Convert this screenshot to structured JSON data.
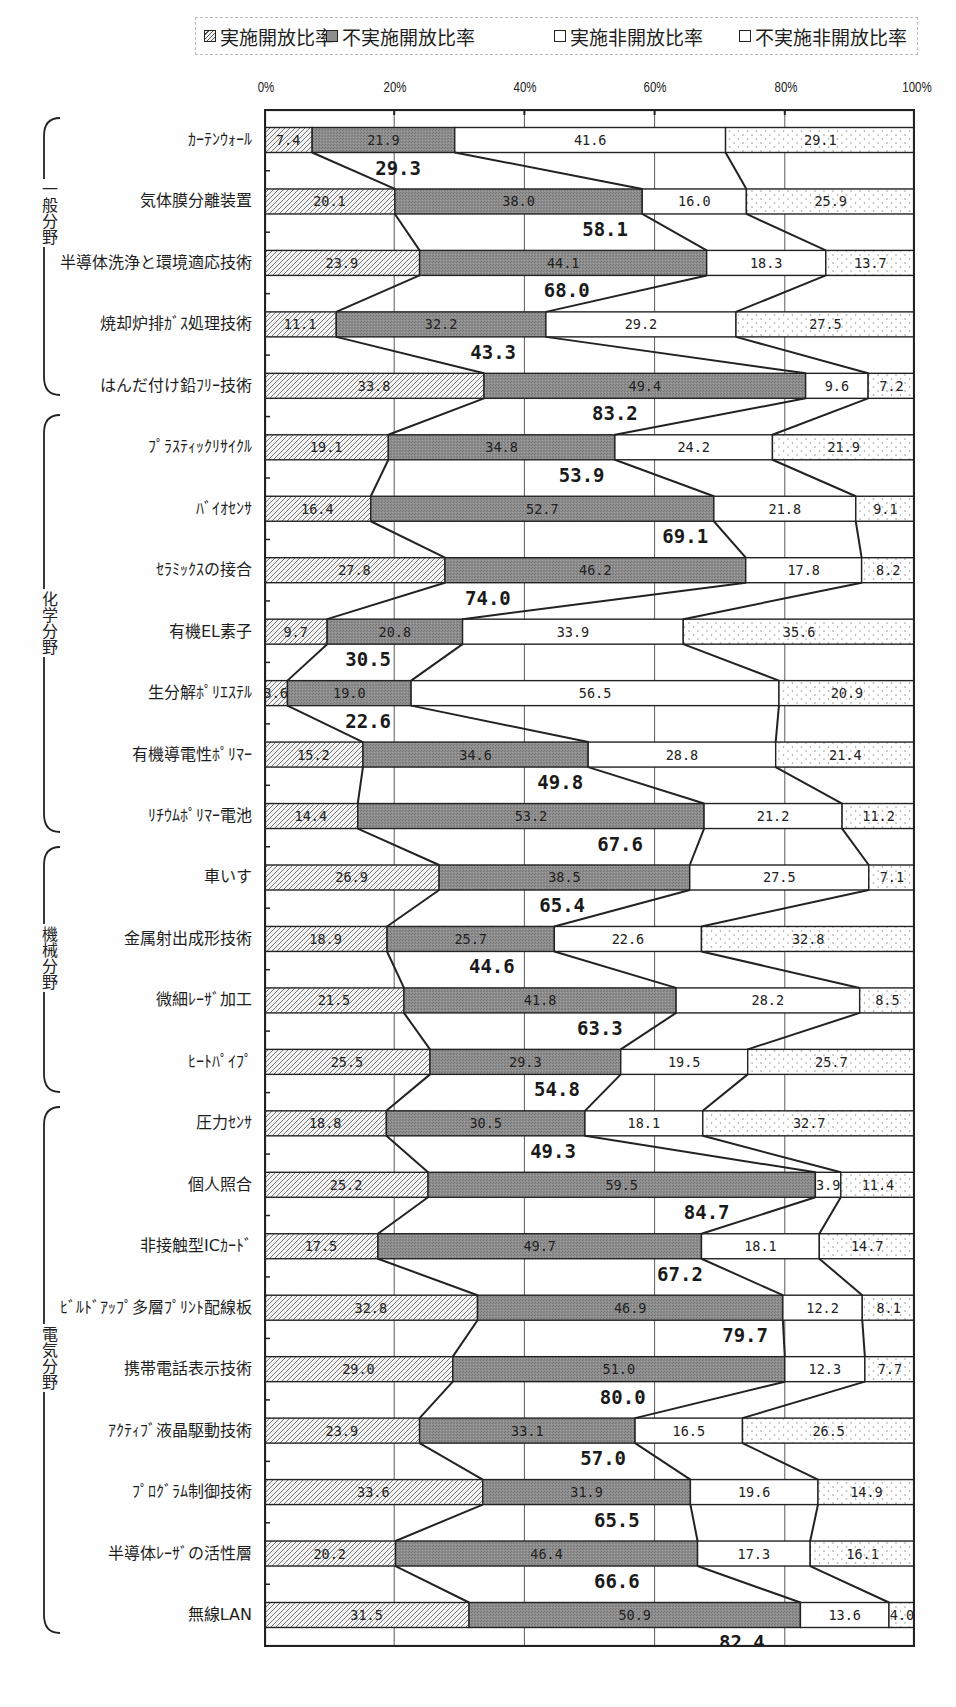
{
  "legend": {
    "items": [
      {
        "label": "実施開放比率",
        "pattern": "hatched"
      },
      {
        "label": "不実施開放比率",
        "pattern": "dark-stipple"
      },
      {
        "label": "実施非開放比率",
        "pattern": "white"
      },
      {
        "label": "不実施非開放比率",
        "pattern": "dotted"
      }
    ]
  },
  "chart_data": {
    "type": "bar",
    "orientation": "horizontal",
    "stacked": true,
    "title": "",
    "xlabel": "",
    "ylabel": "",
    "xlim": [
      0,
      100
    ],
    "x_ticks": [
      "0%",
      "20%",
      "40%",
      "60%",
      "80%",
      "100%"
    ],
    "grid": {
      "vertical": true,
      "horizontal": false
    },
    "legend_position": "top",
    "categories": [
      "ｶｰﾃﾝｳｫｰﾙ",
      "気体膜分離装置",
      "半導体洗浄と環境適応技術",
      "焼却炉排ｶﾞｽ処理技術",
      "はんだ付け鉛ﾌﾘｰ技術",
      "ﾌﾟﾗｽﾃｨｯｸﾘｻｲｸﾙ",
      "ﾊﾞｲｵｾﾝｻ",
      "ｾﾗﾐｯｸｽの接合",
      "有機EL素子",
      "生分解ﾎﾟﾘｴｽﾃﾙ",
      "有機導電性ﾎﾟﾘﾏｰ",
      "ﾘﾁｳﾑﾎﾟﾘﾏｰ電池",
      "車いす",
      "金属射出成形技術",
      "微細ﾚｰｻﾞ加工",
      "ﾋｰﾄﾊﾟｲﾌﾟ",
      "圧力ｾﾝｻ",
      "個人照合",
      "非接触型ICｶｰﾄﾞ",
      "ﾋﾞﾙﾄﾞｱｯﾌﾟ多層ﾌﾟﾘﾝﾄ配線板",
      "携帯電話表示技術",
      "ｱｸﾃｨﾌﾞ液晶駆動技術",
      "ﾌﾟﾛｸﾞﾗﾑ制御技術",
      "半導体ﾚｰｻﾞの活性層",
      "無線LAN"
    ],
    "groups": [
      {
        "label": "一般分野",
        "first": 0,
        "last": 4
      },
      {
        "label": "化学分野",
        "first": 5,
        "last": 11
      },
      {
        "label": "機械分野",
        "first": 12,
        "last": 15
      },
      {
        "label": "電気分野",
        "first": 16,
        "last": 24
      }
    ],
    "series": [
      {
        "name": "実施開放比率",
        "pattern": "hatched",
        "values": [
          7.4,
          20.1,
          23.9,
          11.1,
          33.8,
          19.1,
          16.4,
          27.8,
          9.7,
          3.6,
          15.2,
          14.4,
          26.9,
          18.9,
          21.5,
          25.5,
          18.8,
          25.2,
          17.5,
          32.8,
          29.0,
          23.9,
          33.6,
          20.2,
          31.5
        ]
      },
      {
        "name": "不実施開放比率",
        "pattern": "dark-stipple",
        "values": [
          21.9,
          38.0,
          44.1,
          32.2,
          49.4,
          34.8,
          52.7,
          46.2,
          20.8,
          19.0,
          34.6,
          53.2,
          38.5,
          25.7,
          41.8,
          29.3,
          30.5,
          59.5,
          49.7,
          46.9,
          51.0,
          33.1,
          31.9,
          46.4,
          50.9
        ]
      },
      {
        "name": "実施非開放比率",
        "pattern": "white",
        "values": [
          41.6,
          16.0,
          18.3,
          29.2,
          9.6,
          24.2,
          21.8,
          17.8,
          33.9,
          56.5,
          28.8,
          21.2,
          27.5,
          22.6,
          28.2,
          19.5,
          18.1,
          3.9,
          18.1,
          12.2,
          12.3,
          16.5,
          19.6,
          17.3,
          13.6
        ]
      },
      {
        "name": "不実施非開放比率",
        "pattern": "dotted",
        "values": [
          29.1,
          25.9,
          13.7,
          27.5,
          7.2,
          21.9,
          9.1,
          8.2,
          35.6,
          20.9,
          21.4,
          11.2,
          7.1,
          32.8,
          8.5,
          25.7,
          32.7,
          11.4,
          14.7,
          8.1,
          7.7,
          26.5,
          14.9,
          16.1,
          4.0
        ]
      }
    ],
    "annotations": {
      "open_ratio_totals": [
        29.3,
        58.1,
        68.0,
        43.3,
        83.2,
        53.9,
        69.1,
        74.0,
        30.5,
        22.6,
        49.8,
        67.6,
        65.4,
        44.6,
        63.3,
        54.8,
        49.3,
        84.7,
        67.2,
        79.7,
        80.0,
        57.0,
        65.5,
        66.6,
        82.4
      ]
    }
  },
  "colors": {
    "background": "#fefefe",
    "frame": "#222222",
    "gridline": "#5a5a5a",
    "hatch_line": "#6a6a6a",
    "hatch_bg": "#f3f3f3",
    "dark_fill": "#8e8e8e",
    "dark_stipple": "#767676",
    "dot": "#9a9a9a",
    "white_fill": "#ffffff"
  }
}
